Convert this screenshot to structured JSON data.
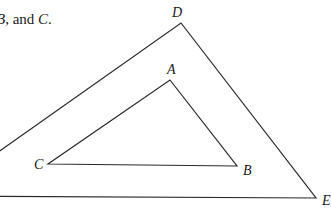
{
  "caption": {
    "prefix": "B",
    "middle": ", and ",
    "suffix_var": "C",
    "end": "."
  },
  "diagram": {
    "stroke_color": "#2a2a2a",
    "outer_triangle": {
      "vertices": {
        "D": {
          "label": "D",
          "x": 181,
          "y": 23
        },
        "E": {
          "label": "E",
          "x": 316,
          "y": 198
        },
        "F": {
          "label": "",
          "x": -64,
          "y": 196
        }
      }
    },
    "inner_triangle": {
      "vertices": {
        "A": {
          "label": "A",
          "x": 170,
          "y": 80
        },
        "B": {
          "label": "B",
          "x": 237,
          "y": 166
        },
        "C": {
          "label": "C",
          "x": 48,
          "y": 164
        }
      }
    }
  }
}
